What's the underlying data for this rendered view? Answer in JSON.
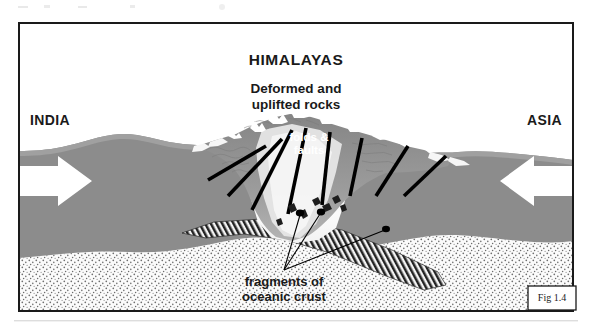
{
  "figure": {
    "domain": "Diagram",
    "kind": "geological-cross-section",
    "frame_label": "Fig 1.4",
    "background_color": "#ffffff",
    "frame_border_color": "#1a1a1a"
  },
  "labels": {
    "title": "HIMALAYAS",
    "subtitle_line1": "Deformed and",
    "subtitle_line2": "uplifted rocks",
    "left_plate": "INDIA",
    "right_plate": "ASIA",
    "center_line1": "folds &",
    "center_line2": "faults",
    "caption_line1": "fragments of",
    "caption_line2": "oceanic crust"
  },
  "colors": {
    "crust_gray": "#8c8c8c",
    "crust_gray_light": "#a3a3a3",
    "crust_gray_dark": "#6f6f6f",
    "mountain_mid": "#9a9a9a",
    "mountain_core_light": "#f2f2f2",
    "mantle_stipple_bg": "#fbfbfb",
    "mantle_stipple_dot": "#6b6b6b",
    "slab_hatch": "#2b2b2b",
    "fault_line": "#000000",
    "arrow_fill": "#ffffff",
    "text_dark": "#1a1a1a",
    "text_white": "#ffffff"
  },
  "arrows": [
    {
      "name": "india-convergence-arrow",
      "direction": "right",
      "fill": "#ffffff"
    },
    {
      "name": "asia-convergence-arrow",
      "direction": "left",
      "fill": "#ffffff"
    }
  ],
  "fault_lines": {
    "count": 8,
    "description": "thick black thrust-fault lines radiating outward and downward from the orogenic core"
  },
  "leader_pointers": {
    "count": 3,
    "target_names": [
      "ophiolite-fragment-1",
      "ophiolite-fragment-2",
      "ophiolite-fragment-3"
    ],
    "origin": "fragments-of-oceanic-crust caption"
  },
  "layers": [
    {
      "name": "continental-crust",
      "fill": "#8c8c8c"
    },
    {
      "name": "mantle",
      "fill": "stipple"
    },
    {
      "name": "subducted-oceanic-slab",
      "fill": "diagonal-hatch"
    },
    {
      "name": "orogen-core",
      "fill": "light-gradient"
    }
  ]
}
